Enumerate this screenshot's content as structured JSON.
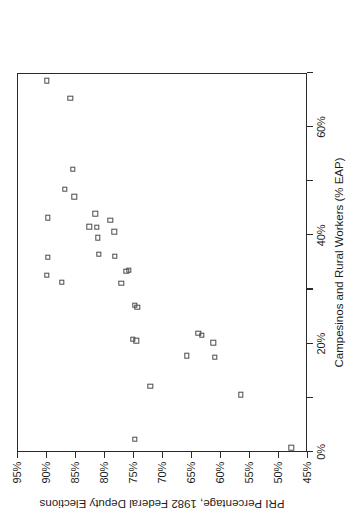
{
  "chart_data": {
    "type": "scatter",
    "title": "",
    "xlabel": "Campesinos and Rural Workers (% EAP)",
    "ylabel": "PRI Percentage, 1982 Federal Deputy Elections",
    "xlim": [
      0,
      70
    ],
    "ylim": [
      45,
      95
    ],
    "xticks": [
      0,
      10,
      20,
      30,
      40,
      50,
      60,
      70
    ],
    "xticklabels": [
      "0%",
      "",
      "20%",
      "",
      "40%",
      "",
      "60%",
      ""
    ],
    "yticks": [
      95,
      90,
      85,
      80,
      75,
      70,
      65,
      60,
      55,
      50,
      45
    ],
    "yticklabels": [
      "95%",
      "90%",
      "85%",
      "80%",
      "75%",
      "70%",
      "65%",
      "60%",
      "55%",
      "50%",
      "45%"
    ],
    "grid": false,
    "legend": null,
    "marker": "open-square",
    "marker_color": "#4a4a4a",
    "rotation_deg": -90,
    "points": [
      {
        "x": 68.4,
        "y": 90.0
      },
      {
        "x": 65.2,
        "y": 86.0
      },
      {
        "x": 52.0,
        "y": 85.5
      },
      {
        "x": 48.3,
        "y": 86.9
      },
      {
        "x": 47.0,
        "y": 85.3
      },
      {
        "x": 43.8,
        "y": 81.7
      },
      {
        "x": 43.1,
        "y": 89.9
      },
      {
        "x": 42.6,
        "y": 79.1
      },
      {
        "x": 41.4,
        "y": 82.7
      },
      {
        "x": 41.3,
        "y": 81.4
      },
      {
        "x": 40.5,
        "y": 78.4
      },
      {
        "x": 39.4,
        "y": 81.2
      },
      {
        "x": 36.3,
        "y": 81.1
      },
      {
        "x": 36.0,
        "y": 78.3
      },
      {
        "x": 35.8,
        "y": 89.9
      },
      {
        "x": 33.4,
        "y": 75.9
      },
      {
        "x": 33.2,
        "y": 76.3
      },
      {
        "x": 32.5,
        "y": 90.0
      },
      {
        "x": 31.2,
        "y": 87.4
      },
      {
        "x": 31.0,
        "y": 77.2
      },
      {
        "x": 26.9,
        "y": 74.9
      },
      {
        "x": 26.6,
        "y": 74.4
      },
      {
        "x": 21.8,
        "y": 63.9
      },
      {
        "x": 21.4,
        "y": 63.3
      },
      {
        "x": 20.7,
        "y": 75.2
      },
      {
        "x": 20.4,
        "y": 74.6
      },
      {
        "x": 20.0,
        "y": 61.3
      },
      {
        "x": 17.6,
        "y": 65.9
      },
      {
        "x": 17.3,
        "y": 61.1
      },
      {
        "x": 12.0,
        "y": 72.2
      },
      {
        "x": 10.4,
        "y": 56.6
      },
      {
        "x": 2.2,
        "y": 74.9
      },
      {
        "x": 0.6,
        "y": 47.9
      }
    ]
  }
}
